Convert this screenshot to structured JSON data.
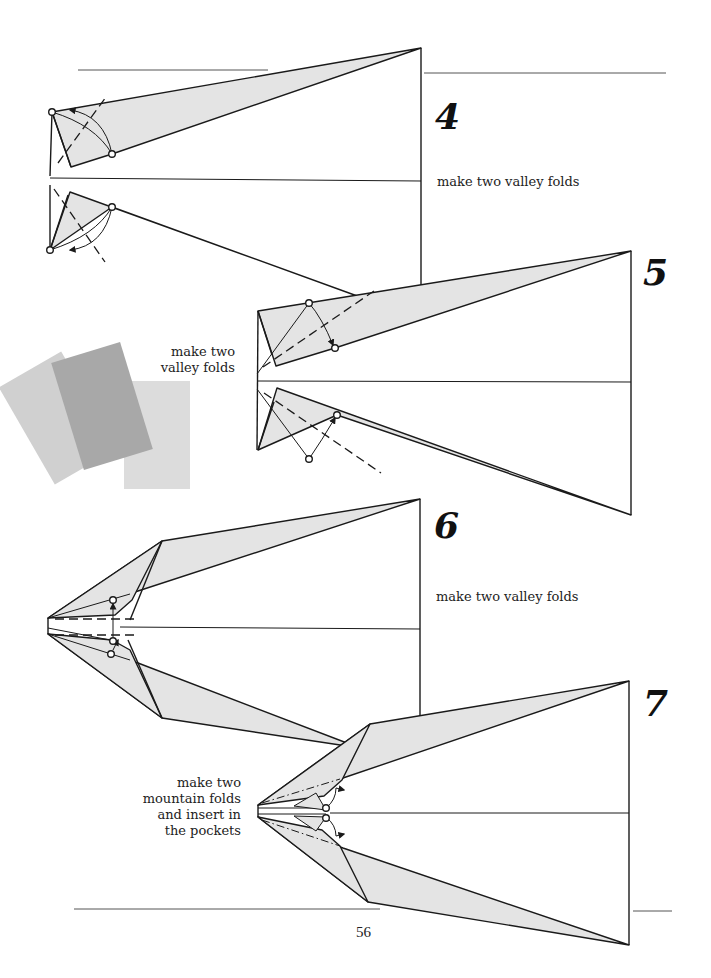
{
  "page": {
    "number": "56"
  },
  "steps": [
    {
      "number": "4",
      "caption": "make two valley folds"
    },
    {
      "number": "5",
      "caption_line1": "make two",
      "caption_line2": "valley folds"
    },
    {
      "number": "6",
      "caption": "make two valley folds"
    },
    {
      "number": "7",
      "caption_line1": "make two",
      "caption_line2": "mountain folds",
      "caption_line3": "and insert in",
      "caption_line4": "the pockets"
    }
  ],
  "colors": {
    "paper_fill": "#e4e4e4",
    "line": "#1a1a1a",
    "rule": "#555555",
    "sheet_light": "#d3d3d3",
    "sheet_mid": "#a9a9a9",
    "sheet_pale": "#dcdcdc"
  },
  "icons": {
    "fold_point": "open-circle",
    "fold_arrow": "curved-arrow",
    "valley_fold_line": "dashed-line",
    "mountain_fold_line": "dash-dot-line"
  }
}
